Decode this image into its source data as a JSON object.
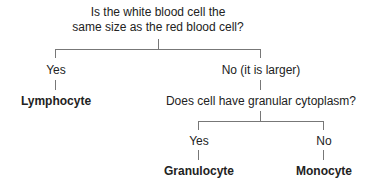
{
  "root": {
    "question_line1": "Is the white blood cell the",
    "question_line2": "same size as the red blood cell?"
  },
  "branch_yes": {
    "label": "Yes",
    "result": "Lymphocyte"
  },
  "branch_no": {
    "label": "No (it is larger)",
    "question": "Does cell have granular cytoplasm?"
  },
  "sub_yes": {
    "label": "Yes",
    "result": "Granulocyte"
  },
  "sub_no": {
    "label": "No",
    "result": "Monocyte"
  }
}
